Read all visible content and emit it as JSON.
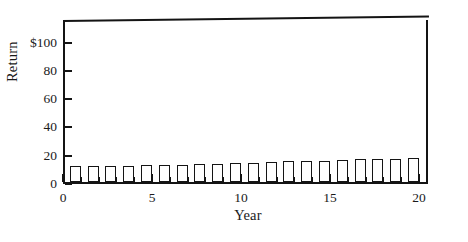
{
  "chart_data": {
    "type": "bar",
    "title": "",
    "subtitle": "",
    "xlabel": "Year",
    "ylabel": "Return",
    "grid": false,
    "legend": null,
    "xlim": [
      0,
      20.5
    ],
    "ylim": [
      0,
      116
    ],
    "x_ticks": [
      0,
      5,
      10,
      15,
      20
    ],
    "x_tick_labels": [
      "0",
      "5",
      "10",
      "15",
      "20"
    ],
    "x_minor_tick_step": 1,
    "y_ticks": [
      0,
      20,
      40,
      60,
      80,
      100
    ],
    "y_tick_labels": [
      "0",
      "20",
      "40",
      "60",
      "80",
      "$100"
    ],
    "categories": [
      1,
      2,
      3,
      4,
      5,
      6,
      7,
      8,
      9,
      10,
      11,
      12,
      13,
      14,
      15,
      16,
      17,
      18,
      19,
      20
    ],
    "values": [
      11,
      11,
      11.3,
      11.5,
      11.7,
      12,
      12.2,
      12.5,
      13,
      13.2,
      13.8,
      14.2,
      14.7,
      15,
      15.2,
      15.5,
      16,
      16.2,
      16.5,
      17
    ],
    "bar_fill": "#ffffff",
    "bar_edge": "#141414",
    "bar_width_years": 0.62,
    "axis_color": "#141414",
    "frame_sides": [
      "left",
      "bottom",
      "top",
      "right"
    ]
  },
  "axis_labels": {
    "y_title": "Return",
    "x_title": "Year"
  }
}
